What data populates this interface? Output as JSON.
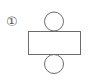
{
  "diagram": {
    "label": "①",
    "stroke_color": "#6b6b6b",
    "shapes": {
      "top_circle": {
        "cx": 54,
        "cy": 21.5,
        "r": 9.5
      },
      "rectangle": {
        "x": 28,
        "y": 31,
        "width": 53,
        "height": 23
      },
      "bottom_circle": {
        "cx": 54,
        "cy": 64,
        "r": 9.5
      }
    }
  }
}
